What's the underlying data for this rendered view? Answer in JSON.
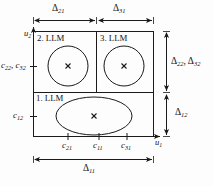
{
  "figure": {
    "type": "diagram",
    "axes": {
      "x_label": "u1",
      "x_label_plain": "u",
      "x_label_sub": "1",
      "y_label": "u2",
      "y_label_plain": "u",
      "y_label_sub": "2"
    },
    "regions": [
      {
        "id": "llm1",
        "label": "1. LLM",
        "label_x": 36,
        "label_y": 92
      },
      {
        "id": "llm2",
        "label": "2. LLM",
        "label_x": 40,
        "label_y": 38
      },
      {
        "id": "llm3",
        "label": "3. LLM",
        "label_x": 99,
        "label_y": 38
      }
    ],
    "centers": [
      {
        "id": "c11",
        "axis": "u1",
        "base": "c",
        "sub": "11"
      },
      {
        "id": "c21",
        "axis": "u1",
        "base": "c",
        "sub": "21"
      },
      {
        "id": "c31",
        "axis": "u1",
        "base": "c",
        "sub": "31"
      },
      {
        "id": "c12",
        "axis": "u2",
        "base": "c",
        "sub": "12"
      },
      {
        "id": "c22_c32",
        "axis": "u2",
        "base": "c",
        "sub": "22"
      }
    ],
    "tick_labels": {
      "x": [
        {
          "name": "c21",
          "base": "c",
          "sub": "21",
          "x": 63,
          "y": 146
        },
        {
          "name": "c11",
          "base": "c",
          "sub": "11",
          "x": 94,
          "y": 146
        },
        {
          "name": "c31",
          "base": "c",
          "sub": "31",
          "x": 122,
          "y": 146
        }
      ],
      "y": [
        {
          "name": "c22-c32",
          "text_a": "c",
          "sub_a": "22",
          "text_b": "c",
          "sub_b": "32",
          "x": 2,
          "y": 66
        },
        {
          "name": "c12",
          "text_a": "c",
          "sub_a": "12",
          "x": 14,
          "y": 114
        }
      ]
    },
    "dimensions": {
      "top": [
        {
          "name": "delta21",
          "base": "Δ",
          "sub": "21",
          "x": 52,
          "y": 6
        },
        {
          "name": "delta31",
          "base": "Δ",
          "sub": "31",
          "x": 113,
          "y": 6
        }
      ],
      "right": [
        {
          "name": "delta22-delta32",
          "base_a": "Δ",
          "sub_a": "22",
          "base_b": "Δ",
          "sub_b": "32",
          "x": 172,
          "y": 62
        },
        {
          "name": "delta12",
          "base": "Δ",
          "sub": "12",
          "x": 178,
          "y": 112
        }
      ],
      "bottom": [
        {
          "name": "delta11",
          "base": "Δ",
          "sub": "11",
          "x": 83,
          "y": 168
        }
      ]
    },
    "validity_functions": [
      {
        "name": "ellipse-llm1",
        "shape": "ellipse",
        "cx": 94,
        "cy": 116,
        "rx": 38,
        "ry": 19
      },
      {
        "name": "circle-llm2",
        "shape": "circle",
        "cx": 68,
        "cy": 66,
        "r": 20
      },
      {
        "name": "circle-llm3",
        "shape": "circle",
        "cx": 124,
        "cy": 66,
        "r": 20
      }
    ],
    "center_markers": [
      {
        "name": "center-marker-llm1",
        "cx": 94,
        "cy": 116
      },
      {
        "name": "center-marker-llm2",
        "cx": 68,
        "cy": 66
      },
      {
        "name": "center-marker-llm3",
        "cx": 124,
        "cy": 66
      }
    ],
    "colors": {
      "stroke": "#1a1a1a",
      "background": "#fdfdfd",
      "text": "#111111"
    }
  }
}
